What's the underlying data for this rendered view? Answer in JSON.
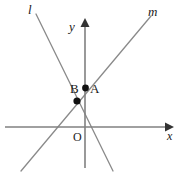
{
  "figure": {
    "background_color": "#ffffff",
    "axis_color": "#808080",
    "line_color": "#8a8a8a",
    "point_color": "#111111",
    "label_color": "#1a1a1a",
    "width": 183,
    "height": 175
  },
  "axes": {
    "x_label": "x",
    "y_label": "y",
    "origin_label": "O",
    "origin": {
      "x": 85,
      "y": 127
    },
    "x_axis": {
      "x1": 5,
      "y1": 127,
      "x2": 170,
      "y2": 127
    },
    "y_axis": {
      "x1": 85,
      "y1": 168,
      "x2": 85,
      "y2": 22
    }
  },
  "lines": [
    {
      "name": "l",
      "label": "l",
      "label_position": {
        "x": 28,
        "y": 3
      },
      "x1": 36,
      "y1": 14,
      "x2": 113,
      "y2": 171,
      "slope_sign": "negative"
    },
    {
      "name": "m",
      "label": "m",
      "label_position": {
        "x": 148,
        "y": 5
      },
      "x1": 21,
      "y1": 171,
      "x2": 151,
      "y2": 16,
      "slope_sign": "positive"
    }
  ],
  "points": [
    {
      "name": "A",
      "label": "A",
      "x": 85.5,
      "y": 88,
      "radius": 3.4,
      "label_position": {
        "x": 90,
        "y": 82
      },
      "description": "point on the y-axis lying on line m"
    },
    {
      "name": "B",
      "label": "B",
      "x": 77,
      "y": 101,
      "radius": 3.6,
      "label_position": {
        "x": 70,
        "y": 82
      },
      "description": "intersection point of line l and line m"
    }
  ]
}
